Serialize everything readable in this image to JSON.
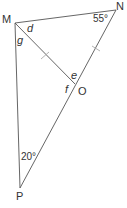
{
  "diagram": {
    "type": "geometry",
    "vertices": {
      "M": {
        "label": "M",
        "x": 15,
        "y": 23
      },
      "N": {
        "label": "N",
        "x": 116,
        "y": 10
      },
      "O": {
        "label": "O",
        "x": 75,
        "y": 84
      },
      "P": {
        "label": "P",
        "x": 20,
        "y": 188
      }
    },
    "segments": [
      {
        "from": "M",
        "to": "N"
      },
      {
        "from": "M",
        "to": "O"
      },
      {
        "from": "N",
        "to": "P"
      },
      {
        "from": "M",
        "to": "P"
      }
    ],
    "equal_marks": [
      "MO",
      "NO"
    ],
    "angle_labels": {
      "d": "d",
      "g": "g",
      "e": "e",
      "f": "f",
      "angle_N": "55°",
      "angle_P": "20°"
    },
    "colors": {
      "line": "#555555",
      "tick": "#aaaaaa",
      "text": "#333333"
    }
  }
}
